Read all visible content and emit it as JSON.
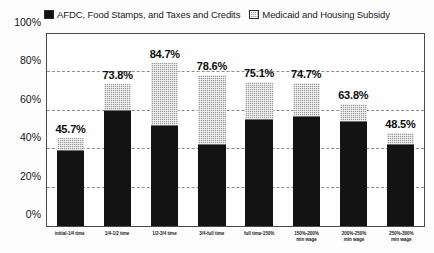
{
  "legend": {
    "entries": [
      {
        "label": "AFDC, Food Stamps, and Taxes and Credits",
        "pattern": "solid",
        "color": "#131313"
      },
      {
        "label": "Medicaid and Housing Subsidy",
        "pattern": "hatch",
        "color": "#9d9d9d"
      }
    ]
  },
  "chart_data": {
    "type": "bar",
    "subtype": "stacked-vertical",
    "title": "",
    "subtitle": "",
    "xlabel": "",
    "ylabel": "",
    "ylim": [
      0,
      100
    ],
    "yticks": [
      "0%",
      "20%",
      "40%",
      "60%",
      "80%",
      "100%"
    ],
    "ytick_values": [
      0,
      20,
      40,
      60,
      80,
      100
    ],
    "grid": true,
    "gridlines_at": [
      20,
      40,
      60,
      80
    ],
    "legend_position": "top-center",
    "value_suffix": "%",
    "categories": [
      "initial-1/4 time",
      "1/4-1/2 time",
      "1/2-3/4 time",
      "3/4-full time",
      "full time-150%",
      "150%-200%\nmin wage",
      "200%-250%\nmin wage",
      "250%-300%\nmin wage"
    ],
    "series": [
      {
        "name": "AFDC, Food Stamps, and Taxes and Credits",
        "values": [
          39.0,
          60.0,
          52.0,
          42.0,
          55.0,
          57.0,
          54.0,
          42.0
        ]
      },
      {
        "name": "Medicaid and Housing Subsidy",
        "values": [
          6.7,
          13.8,
          32.7,
          36.6,
          20.1,
          17.7,
          9.8,
          6.5
        ]
      }
    ],
    "totals": [
      45.7,
      73.8,
      84.7,
      78.6,
      75.1,
      74.7,
      63.8,
      48.5
    ],
    "total_labels": [
      "45.7%",
      "73.8%",
      "84.7%",
      "78.6%",
      "75.1%",
      "74.7%",
      "63.8%",
      "48.5%"
    ]
  }
}
